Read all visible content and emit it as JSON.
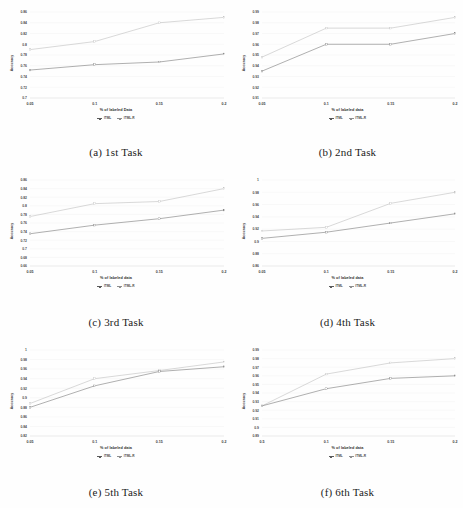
{
  "figure": {
    "panel_count": 6,
    "series_names": [
      "ITML",
      "ITML-R"
    ],
    "colors": {
      "series_itml": "#6e6e6e",
      "series_itml_r": "#b9b9b9",
      "grid": "#ececec",
      "text": "#3d3d3d"
    }
  },
  "panels": [
    {
      "id": "panel-a",
      "caption": "(a) 1st Task",
      "xlabel": "% of labeled Data",
      "ylabel": "Accuracy",
      "legend": [
        "ITML",
        "ITML-R"
      ],
      "chart_data": {
        "type": "line",
        "title": "(a) 1st Task",
        "xlabel": "% of labeled Data",
        "ylabel": "Accuracy",
        "x": [
          0.05,
          0.1,
          0.15,
          0.2
        ],
        "xtick_labels": [
          "0.05",
          "0.1",
          "0.15",
          "0.2"
        ],
        "ytick_labels": [
          "0.7",
          "0.72",
          "0.74",
          "0.76",
          "0.78",
          "0.8",
          "0.82",
          "0.84",
          "0.86"
        ],
        "yticks": [
          0.7,
          0.72,
          0.74,
          0.76,
          0.78,
          0.8,
          0.82,
          0.84,
          0.86
        ],
        "ylim": [
          0.7,
          0.86
        ],
        "grid": true,
        "legend_position": "below",
        "series": [
          {
            "name": "ITML",
            "values": [
              0.752,
              0.762,
              0.767,
              0.782
            ]
          },
          {
            "name": "ITML-R",
            "values": [
              0.79,
              0.805,
              0.84,
              0.85
            ]
          }
        ]
      }
    },
    {
      "id": "panel-b",
      "caption": "(b) 2nd Task",
      "xlabel": "% of labeled data",
      "ylabel": "Accuracy",
      "legend": [
        "ITML",
        "ITML-R"
      ],
      "chart_data": {
        "type": "line",
        "title": "(b) 2nd Task",
        "xlabel": "% of labeled data",
        "ylabel": "Accuracy",
        "x": [
          0.05,
          0.1,
          0.15,
          0.2
        ],
        "xtick_labels": [
          "0.05",
          "0.1",
          "0.15",
          "0.2"
        ],
        "ytick_labels": [
          "0.91",
          "0.92",
          "0.93",
          "0.94",
          "0.95",
          "0.96",
          "0.97",
          "0.98",
          "0.99"
        ],
        "yticks": [
          0.91,
          0.92,
          0.93,
          0.94,
          0.95,
          0.96,
          0.97,
          0.98,
          0.99
        ],
        "ylim": [
          0.91,
          0.99
        ],
        "grid": true,
        "legend_position": "below",
        "series": [
          {
            "name": "ITML",
            "values": [
              0.935,
              0.96,
              0.96,
              0.97
            ]
          },
          {
            "name": "ITML-R",
            "values": [
              0.948,
              0.975,
              0.975,
              0.985
            ]
          }
        ]
      }
    },
    {
      "id": "panel-c",
      "caption": "(c) 3rd Task",
      "xlabel": "% of labeled data",
      "ylabel": "Accuracy",
      "legend": [
        "ITML",
        "ITML-R"
      ],
      "chart_data": {
        "type": "line",
        "title": "(c) 3rd Task",
        "xlabel": "% of labeled data",
        "ylabel": "Accuracy",
        "x": [
          0.05,
          0.1,
          0.15,
          0.2
        ],
        "xtick_labels": [
          "0.05",
          "0.1",
          "0.15",
          "0.2"
        ],
        "ytick_labels": [
          "0.66",
          "0.68",
          "0.7",
          "0.72",
          "0.74",
          "0.76",
          "0.78",
          "0.8",
          "0.82",
          "0.84",
          "0.86"
        ],
        "yticks": [
          0.66,
          0.68,
          0.7,
          0.72,
          0.74,
          0.76,
          0.78,
          0.8,
          0.82,
          0.84,
          0.86
        ],
        "ylim": [
          0.66,
          0.86
        ],
        "grid": true,
        "legend_position": "below",
        "series": [
          {
            "name": "ITML",
            "values": [
              0.735,
              0.755,
              0.77,
              0.79
            ]
          },
          {
            "name": "ITML-R",
            "values": [
              0.775,
              0.805,
              0.81,
              0.84
            ]
          }
        ]
      }
    },
    {
      "id": "panel-d",
      "caption": "(d) 4th Task",
      "xlabel": "% of labeled data",
      "ylabel": "Accuracy",
      "legend": [
        "ITML",
        "ITML-R"
      ],
      "chart_data": {
        "type": "line",
        "title": "(d) 4th Task",
        "xlabel": "% of labeled data",
        "ylabel": "Accuracy",
        "x": [
          0.05,
          0.1,
          0.15,
          0.2
        ],
        "xtick_labels": [
          "0.05",
          "0.1",
          "0.15",
          "0.2"
        ],
        "ytick_labels": [
          "0.86",
          "0.88",
          "0.9",
          "0.92",
          "0.94",
          "0.96",
          "0.98",
          "1"
        ],
        "yticks": [
          0.86,
          0.88,
          0.9,
          0.92,
          0.94,
          0.96,
          0.98,
          1.0
        ],
        "ylim": [
          0.86,
          1.0
        ],
        "grid": true,
        "legend_position": "below",
        "series": [
          {
            "name": "ITML",
            "values": [
              0.905,
              0.915,
              0.93,
              0.945
            ]
          },
          {
            "name": "ITML-R",
            "values": [
              0.917,
              0.923,
              0.962,
              0.98
            ]
          }
        ]
      }
    },
    {
      "id": "panel-e",
      "caption": "(e) 5th Task",
      "xlabel": "% of labeled data",
      "ylabel": "Accuracy",
      "legend": [
        "ITML",
        "ITML-R"
      ],
      "chart_data": {
        "type": "line",
        "title": "(e) 5th Task",
        "xlabel": "% of labeled data",
        "ylabel": "Accuracy",
        "x": [
          0.05,
          0.1,
          0.15,
          0.2
        ],
        "xtick_labels": [
          "0.05",
          "0.1",
          "0.15",
          "0.2"
        ],
        "ytick_labels": [
          "0.82",
          "0.84",
          "0.86",
          "0.88",
          "0.9",
          "0.92",
          "0.94",
          "0.96",
          "0.98",
          "1"
        ],
        "yticks": [
          0.82,
          0.84,
          0.86,
          0.88,
          0.9,
          0.92,
          0.94,
          0.96,
          0.98,
          1.0
        ],
        "ylim": [
          0.82,
          1.0
        ],
        "grid": true,
        "legend_position": "below",
        "series": [
          {
            "name": "ITML",
            "values": [
              0.88,
              0.925,
              0.955,
              0.965
            ]
          },
          {
            "name": "ITML-R",
            "values": [
              0.888,
              0.94,
              0.957,
              0.975
            ]
          }
        ]
      }
    },
    {
      "id": "panel-f",
      "caption": "(f) 6th Task",
      "xlabel": "% of labeled data",
      "ylabel": "Accuracy",
      "legend": [
        "ITML",
        "ITML-R"
      ],
      "chart_data": {
        "type": "line",
        "title": "(f) 6th Task",
        "xlabel": "% of labeled data",
        "ylabel": "Accuracy",
        "x": [
          0.05,
          0.1,
          0.15,
          0.2
        ],
        "xtick_labels": [
          "0.5",
          "0.1",
          "0.15",
          "0.2"
        ],
        "ytick_labels": [
          "0.89",
          "0.9",
          "0.91",
          "0.92",
          "0.93",
          "0.94",
          "0.95",
          "0.96",
          "0.97",
          "0.98",
          "0.99"
        ],
        "yticks": [
          0.89,
          0.9,
          0.91,
          0.92,
          0.93,
          0.94,
          0.95,
          0.96,
          0.97,
          0.98,
          0.99
        ],
        "ylim": [
          0.89,
          0.99
        ],
        "grid": true,
        "legend_position": "below",
        "series": [
          {
            "name": "ITML",
            "values": [
              0.925,
              0.945,
              0.957,
              0.96
            ]
          },
          {
            "name": "ITML-R",
            "values": [
              0.925,
              0.962,
              0.975,
              0.98
            ]
          }
        ]
      }
    }
  ]
}
